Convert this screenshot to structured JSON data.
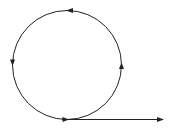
{
  "diagram": {
    "colors": {
      "stroke": "#222222",
      "background": "#ffffff"
    },
    "circle": {
      "cx": 67,
      "cy": 65,
      "r": 54.5
    },
    "arrows_on_circle": [
      {
        "name": "top-arrow",
        "x": 70,
        "y": 10.5,
        "direction": "left"
      },
      {
        "name": "left-arrow",
        "x": 12.5,
        "y": 63,
        "direction": "down"
      },
      {
        "name": "bottom-arrow",
        "x": 66,
        "y": 119.5,
        "direction": "right"
      },
      {
        "name": "right-arrow",
        "x": 121.5,
        "y": 66,
        "direction": "up"
      }
    ],
    "exit_line": {
      "x1": 62,
      "y1": 119.5,
      "x2": 162,
      "y2": 119.5,
      "direction": "right"
    }
  }
}
